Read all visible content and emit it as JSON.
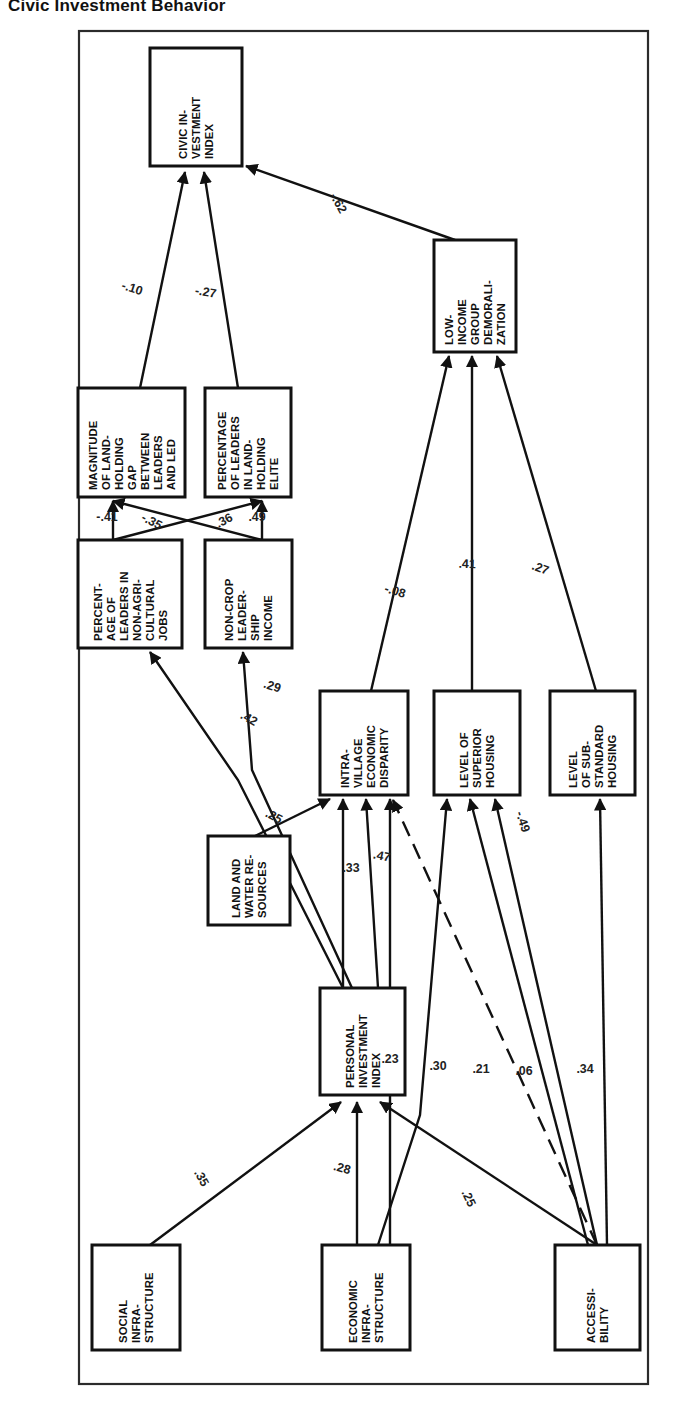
{
  "figure": {
    "title": "Civic Investment Behavior",
    "type": "path-diagram",
    "frame": {
      "x": 78,
      "y": 30,
      "width": 570,
      "height": 1355
    },
    "orientation": "rotated-90-ccw"
  },
  "nodes": [
    {
      "id": "civic",
      "label": "CIVIC IN-\nVESTMENT\nINDEX",
      "x": 150,
      "y": 48,
      "w": 92,
      "h": 118
    },
    {
      "id": "lowincome",
      "label": "LOW-\nINCOME\nGROUP\nDEMORALI-\nZATION",
      "x": 434,
      "y": 240,
      "w": 82,
      "h": 112
    },
    {
      "id": "magnitude",
      "label": "MAGNITUDE\nOF LAND-\nHOLDING\nGAP\nBETWEEN\nLEADERS\nAND LED",
      "x": 78,
      "y": 388,
      "w": 107,
      "h": 109
    },
    {
      "id": "pctelite",
      "label": "PERCENTAGE\nOF LEADERS\nIN LAND-\nHOLDING\nELITE",
      "x": 205,
      "y": 388,
      "w": 86,
      "h": 109
    },
    {
      "id": "nonagri",
      "label": "PERCENT-\nAGE OF\nLEADERS IN\nNON-AGRI-\nCULTURAL\nJOBS",
      "x": 78,
      "y": 540,
      "w": 104,
      "h": 108
    },
    {
      "id": "noncrop",
      "label": "NON-CROP\nLEADER-\nSHIP\nINCOME",
      "x": 205,
      "y": 540,
      "w": 87,
      "h": 108
    },
    {
      "id": "disparity",
      "label": "INTRA-\nVILLAGE\nECONOMIC\nDISPARITY",
      "x": 320,
      "y": 691,
      "w": 88,
      "h": 104
    },
    {
      "id": "superior",
      "label": "LEVEL OF\nSUPERIOR\nHOUSING",
      "x": 434,
      "y": 691,
      "w": 86,
      "h": 104
    },
    {
      "id": "substandard",
      "label": "LEVEL\nOF SUB-\nSTANDARD\nHOUSING",
      "x": 550,
      "y": 691,
      "w": 85,
      "h": 104
    },
    {
      "id": "landwater",
      "label": "LAND AND\nWATER RE-\nSOURCES",
      "x": 208,
      "y": 836,
      "w": 82,
      "h": 89
    },
    {
      "id": "personal",
      "label": "PERSONAL\nINVESTMENT\nINDEX",
      "x": 320,
      "y": 988,
      "w": 85,
      "h": 107
    },
    {
      "id": "socialinfra",
      "label": "SOCIAL\nINFRA-\nSTRUCTURE",
      "x": 92,
      "y": 1245,
      "w": 88,
      "h": 105
    },
    {
      "id": "econinfra",
      "label": "ECONOMIC\nINFRA-\nSTRUCTURE",
      "x": 322,
      "y": 1245,
      "w": 88,
      "h": 105
    },
    {
      "id": "accessibility",
      "label": "ACCESSI-\nBILITY",
      "x": 555,
      "y": 1245,
      "w": 85,
      "h": 105
    }
  ],
  "edges": [
    {
      "from": "magnitude",
      "to": "civic",
      "coefficient": "-.10",
      "label_x": 131,
      "label_y": 292,
      "label_rot": -72,
      "style": "solid"
    },
    {
      "from": "pctelite",
      "to": "civic",
      "coefficient": "-.27",
      "label_x": 205,
      "label_y": 296,
      "label_rot": -80,
      "style": "solid"
    },
    {
      "from": "lowincome",
      "to": "civic",
      "coefficient": "-.62",
      "label_x": 335,
      "label_y": 205,
      "label_rot": -29,
      "style": "solid"
    },
    {
      "from": "nonagri",
      "to": "magnitude",
      "coefficient": "-.41",
      "label_x": 107,
      "label_y": 521,
      "label_rot": -90,
      "style": "solid"
    },
    {
      "from": "nonagri",
      "to": "pctelite",
      "coefficient": "-.35",
      "label_x": 150,
      "label_y": 525,
      "label_rot": -62,
      "style": "solid"
    },
    {
      "from": "noncrop",
      "to": "magnitude",
      "coefficient": ".36",
      "label_x": 226,
      "label_y": 524,
      "label_rot": -118,
      "style": "solid"
    },
    {
      "from": "noncrop",
      "to": "pctelite",
      "coefficient": ".49",
      "label_x": 257,
      "label_y": 521,
      "label_rot": -90,
      "style": "solid"
    },
    {
      "from": "disparity",
      "to": "lowincome",
      "coefficient": "-.08",
      "label_x": 394,
      "label_y": 595,
      "label_rot": -73,
      "style": "solid"
    },
    {
      "from": "superior",
      "to": "lowincome",
      "coefficient": ".41",
      "label_x": 467,
      "label_y": 568,
      "label_rot": -88,
      "style": "solid"
    },
    {
      "from": "substandard",
      "to": "lowincome",
      "coefficient": ".27",
      "label_x": 539,
      "label_y": 572,
      "label_rot": -70,
      "style": "solid"
    },
    {
      "from": "personal",
      "to": "nonagri",
      "coefficient": ".42",
      "label_x": 247,
      "label_y": 722,
      "label_rot": -60,
      "style": "solid"
    },
    {
      "from": "personal",
      "to": "noncrop",
      "coefficient": ".29",
      "label_x": 271,
      "label_y": 690,
      "label_rot": -72,
      "style": "solid"
    },
    {
      "from": "landwater",
      "to": "disparity",
      "coefficient": ".25",
      "label_x": 272,
      "label_y": 820,
      "label_rot": -62,
      "style": "solid"
    },
    {
      "from": "personal",
      "to": "disparity",
      "coefficient": ".33",
      "label_x": 351,
      "label_y": 872,
      "label_rot": -90,
      "style": "solid"
    },
    {
      "from": "personal",
      "to": "disparity2",
      "coefficient": ".47",
      "label_x": 381,
      "label_y": 860,
      "label_rot": -78,
      "style": "solid"
    },
    {
      "from": "accessibility",
      "to": "superior",
      "coefficient": "-.49",
      "label_x": 519,
      "label_y": 823,
      "label_rot": -18,
      "style": "dashed"
    },
    {
      "from": "econinfra",
      "to": "disparity",
      "coefficient": ".23",
      "label_x": 390,
      "label_y": 1063,
      "label_rot": -90,
      "style": "solid"
    },
    {
      "from": "econinfra",
      "to": "superior",
      "coefficient": ".30",
      "label_x": 438,
      "label_y": 1070,
      "label_rot": -90,
      "style": "solid"
    },
    {
      "from": "accessibility",
      "to": "disparity",
      "coefficient": ".21",
      "label_x": 481,
      "label_y": 1073,
      "label_rot": -90,
      "style": "solid"
    },
    {
      "from": "accessibility",
      "to": "superior",
      "coefficient": ".06",
      "label_x": 524,
      "label_y": 1075,
      "label_rot": -90,
      "style": "solid"
    },
    {
      "from": "accessibility",
      "to": "substandard",
      "coefficient": ".34",
      "label_x": 585,
      "label_y": 1073,
      "label_rot": -90,
      "style": "solid"
    },
    {
      "from": "socialinfra",
      "to": "personal",
      "coefficient": ".35",
      "label_x": 198,
      "label_y": 1180,
      "label_rot": -30,
      "style": "solid"
    },
    {
      "from": "econinfra",
      "to": "personal",
      "coefficient": ".28",
      "label_x": 341,
      "label_y": 1172,
      "label_rot": -75,
      "style": "solid"
    },
    {
      "from": "accessibility",
      "to": "personal",
      "coefficient": ".25",
      "label_x": 465,
      "label_y": 1200,
      "label_rot": -25,
      "style": "solid"
    }
  ]
}
